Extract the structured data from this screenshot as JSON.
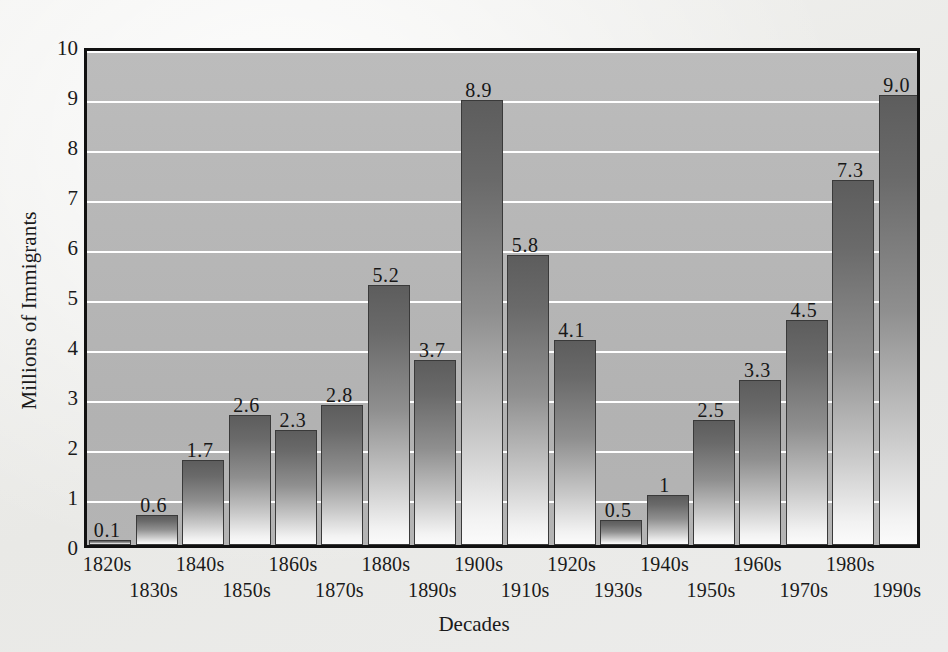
{
  "chart_data": {
    "type": "bar",
    "title": "",
    "xlabel": "Decades",
    "ylabel": "Millions of Immigrants",
    "categories": [
      "1820s",
      "1830s",
      "1840s",
      "1850s",
      "1860s",
      "1870s",
      "1880s",
      "1890s",
      "1900s",
      "1910s",
      "1920s",
      "1930s",
      "1940s",
      "1950s",
      "1960s",
      "1970s",
      "1980s",
      "1990s"
    ],
    "values": [
      0.1,
      0.6,
      1.7,
      2.6,
      2.3,
      2.8,
      5.2,
      3.7,
      8.9,
      5.8,
      4.1,
      0.5,
      1,
      2.5,
      3.3,
      4.5,
      7.3,
      9.0
    ],
    "value_labels": [
      "0.1",
      "0.6",
      "1.7",
      "2.6",
      "2.3",
      "2.8",
      "5.2",
      "3.7",
      "8.9",
      "5.8",
      "4.1",
      "0.5",
      "1",
      "2.5",
      "3.3",
      "4.5",
      "7.3",
      "9.0"
    ],
    "ylim": [
      0,
      10
    ],
    "y_ticks": [
      0,
      1,
      2,
      3,
      4,
      5,
      6,
      7,
      8,
      9,
      10
    ],
    "y_tick_labels": [
      "0",
      "1",
      "2",
      "3",
      "4",
      "5",
      "6",
      "7",
      "8",
      "9",
      "10"
    ],
    "grid": true,
    "grid_color": "#ffffff",
    "legend": false,
    "plot_background": "#b6b6b6",
    "page_background": "#ecece9",
    "bar_color_top": "#5d5d5d",
    "bar_color_bottom": "#fbfbfb",
    "border_color": "#111111"
  }
}
